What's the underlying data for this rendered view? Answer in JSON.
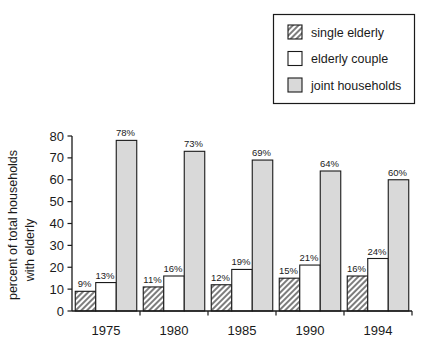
{
  "chart_data": {
    "type": "bar",
    "title": "",
    "subtitle": "",
    "xlabel": "",
    "ylabel_line1": "percent of total households",
    "ylabel_line2": "with elderly",
    "categories": [
      "1975",
      "1980",
      "1985",
      "1990",
      "1994"
    ],
    "series": [
      {
        "name": "single elderly",
        "pattern": "hatch",
        "color": "#8c8c8c",
        "values": [
          9,
          11,
          12,
          15,
          16
        ],
        "labels": [
          "9%",
          "11%",
          "12%",
          "15%",
          "16%"
        ]
      },
      {
        "name": "elderly couple",
        "pattern": "empty",
        "color": "#ffffff",
        "values": [
          13,
          16,
          19,
          21,
          24
        ],
        "labels": [
          "13%",
          "16%",
          "19%",
          "21%",
          "24%"
        ]
      },
      {
        "name": "joint households",
        "pattern": "solid-gray",
        "color": "#d9d9d9",
        "values": [
          78,
          73,
          69,
          64,
          60
        ],
        "labels": [
          "78%",
          "73%",
          "69%",
          "64%",
          "60%"
        ]
      }
    ],
    "ylim": [
      0,
      80
    ],
    "yticks": [
      0,
      10,
      20,
      30,
      40,
      50,
      60,
      70,
      80
    ],
    "ytick_labels": [
      "0",
      "10",
      "20",
      "30",
      "40",
      "50",
      "60",
      "70",
      "80"
    ],
    "grid": false,
    "legend_position": "top-right",
    "value_unit": "%"
  },
  "legend": {
    "items": [
      {
        "label": "single elderly",
        "swatch": "hatch-swatch"
      },
      {
        "label": "elderly couple",
        "swatch": "empty-swatch"
      },
      {
        "label": "joint households",
        "swatch": "gray-swatch"
      }
    ]
  },
  "colors": {
    "axis": "#1a1a1a",
    "bar_outline": "#1a1a1a",
    "hatch_fill": "#8c8c8c",
    "gray_fill": "#d9d9d9",
    "empty_fill": "#ffffff",
    "background": "#ffffff"
  }
}
